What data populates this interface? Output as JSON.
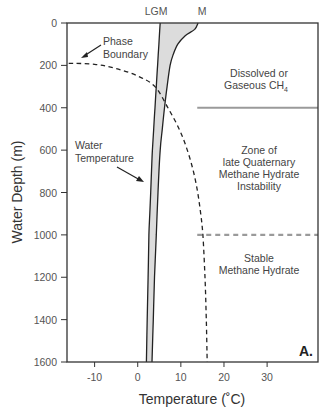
{
  "chart_data": {
    "type": "line",
    "title": "",
    "xlabel": "Temperature (˚C)",
    "ylabel": "Water Depth (m)",
    "xlim": [
      -16.4,
      41.8
    ],
    "ylim": [
      0,
      1600
    ],
    "y_inverted": true,
    "grid": false,
    "x_ticks": [
      -10,
      0,
      10,
      20,
      30
    ],
    "y_ticks": [
      0,
      200,
      400,
      600,
      800,
      1000,
      1200,
      1400,
      1600
    ],
    "panel_label": "A.",
    "series": [
      {
        "name": "LGM",
        "label": "LGM",
        "style": "solid",
        "points": [
          [
            5.2,
            0
          ],
          [
            4.9,
            100
          ],
          [
            4.6,
            200
          ],
          [
            4.3,
            300
          ],
          [
            4.0,
            400
          ],
          [
            3.7,
            500
          ],
          [
            3.4,
            600
          ],
          [
            3.2,
            700
          ],
          [
            3.0,
            800
          ],
          [
            2.8,
            900
          ],
          [
            2.6,
            1000
          ],
          [
            2.4,
            1200
          ],
          [
            2.2,
            1400
          ],
          [
            2.0,
            1600
          ]
        ]
      },
      {
        "name": "M",
        "label": "M",
        "style": "solid",
        "points": [
          [
            14.0,
            0
          ],
          [
            13.2,
            30
          ],
          [
            11.0,
            60
          ],
          [
            9.3,
            100
          ],
          [
            8.2,
            150
          ],
          [
            7.5,
            200
          ],
          [
            6.8,
            300
          ],
          [
            6.2,
            400
          ],
          [
            5.7,
            500
          ],
          [
            5.2,
            600
          ],
          [
            4.7,
            800
          ],
          [
            4.3,
            1000
          ],
          [
            3.9,
            1200
          ],
          [
            3.6,
            1400
          ],
          [
            3.3,
            1600
          ]
        ]
      },
      {
        "name": "Phase Boundary",
        "style": "dashed",
        "points": [
          [
            -16.0,
            190
          ],
          [
            -10.0,
            195
          ],
          [
            -5.0,
            215
          ],
          [
            0.0,
            250
          ],
          [
            4.0,
            300
          ],
          [
            7.0,
            400
          ],
          [
            9.6,
            500
          ],
          [
            11.5,
            600
          ],
          [
            12.9,
            700
          ],
          [
            13.9,
            800
          ],
          [
            14.6,
            900
          ],
          [
            15.1,
            1000
          ],
          [
            15.6,
            1200
          ],
          [
            15.9,
            1400
          ],
          [
            16.1,
            1600
          ]
        ]
      }
    ],
    "shaded_region": {
      "between": [
        "LGM",
        "M"
      ],
      "color": "#dcdcdc"
    },
    "reference_lines": [
      {
        "depth": 400,
        "from_temperature": 13.8,
        "style": "solid",
        "color": "#9a9a9a"
      },
      {
        "depth": 1000,
        "from_temperature": 13.8,
        "style": "dashed",
        "color": "#9a9a9a"
      }
    ],
    "annotations": [
      {
        "text_lines": [
          "Phase",
          "Boundary"
        ],
        "arrow_to": [
          -10.5,
          180
        ]
      },
      {
        "text_lines": [
          "Water",
          "Temperature"
        ],
        "arrow_to": [
          3.5,
          640
        ]
      }
    ],
    "zones": [
      {
        "text_lines": [
          "Dissolved or",
          "Gaseous CH"
        ],
        "subscript": "4"
      },
      {
        "text_lines": [
          "Zone of",
          "late Quaternary",
          "Methane Hydrate",
          "Instability"
        ]
      },
      {
        "text_lines": [
          "Stable",
          "Methane Hydrate"
        ]
      }
    ]
  }
}
